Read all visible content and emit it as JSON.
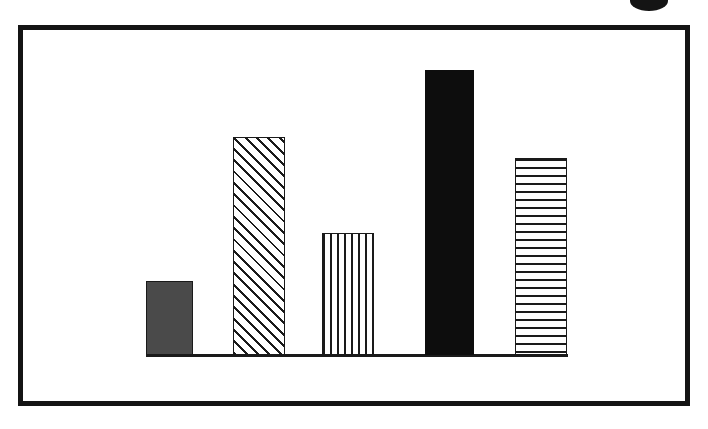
{
  "figure": {
    "background_color": "#ffffff",
    "frame": {
      "name": "chart-frame-border",
      "color": "#141414",
      "thickness_px": 5,
      "left_px": 18,
      "top_px": 25,
      "width_px": 672,
      "height_px": 381
    },
    "top_marker": {
      "name": "page-corner-mark",
      "color": "#141414",
      "left_px": 630,
      "top_px": -9,
      "width_px": 38,
      "height_px": 20
    }
  },
  "chart_data": {
    "type": "bar",
    "title": "",
    "subtitle": "",
    "xlabel": "",
    "ylabel": "",
    "categories": [
      "1",
      "2",
      "3",
      "4",
      "5"
    ],
    "values": [
      74,
      218,
      122,
      285,
      197
    ],
    "ylim": [
      0,
      330
    ],
    "grid": false,
    "legend": false,
    "legend_position": "none",
    "axis_tick_labels_x": [],
    "axis_tick_labels_y": [],
    "annotations": [],
    "series": [
      {
        "name": "series-1",
        "values": [
          74,
          218,
          122,
          285,
          197
        ]
      }
    ],
    "bar_styles": [
      "solid-gray",
      "diagonal-hatch",
      "vertical-lines",
      "solid-black",
      "horizontal-lines"
    ],
    "bar_colors": [
      "#4a4a4a",
      "#ffffff",
      "#ffffff",
      "#0d0d0d",
      "#ffffff"
    ],
    "bar_edge_color": "#1a1a1a",
    "baseline": {
      "name": "x-axis-baseline",
      "color": "#1a1a1a",
      "left_px": 146,
      "top_px": 354,
      "width_px": 422,
      "height_px": 3
    },
    "bar_geometry": [
      {
        "left_px": 146,
        "top_px": 281,
        "width_px": 47,
        "height_px": 74,
        "style": "solid-gray"
      },
      {
        "left_px": 233,
        "top_px": 137,
        "width_px": 52,
        "height_px": 218,
        "style": "diagonal-hatch"
      },
      {
        "left_px": 322,
        "top_px": 233,
        "width_px": 52,
        "height_px": 122,
        "style": "vertical-lines"
      },
      {
        "left_px": 425,
        "top_px": 70,
        "width_px": 49,
        "height_px": 285,
        "style": "solid-black"
      },
      {
        "left_px": 515,
        "top_px": 158,
        "width_px": 52,
        "height_px": 197,
        "style": "horizontal-lines"
      }
    ]
  }
}
